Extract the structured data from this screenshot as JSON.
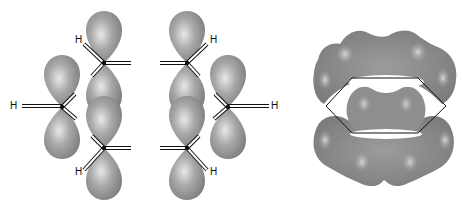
{
  "figure": {
    "left_panel": {
      "name": "p-orbital overlap diagram",
      "atom_label": "H",
      "hydrogens": [
        {
          "id": "h-left",
          "label": "H",
          "x": 10,
          "y": 101
        },
        {
          "id": "h-top-left",
          "label": "H",
          "x": 75,
          "y": 35
        },
        {
          "id": "h-bottom-left",
          "label": "H",
          "x": 75,
          "y": 167
        },
        {
          "id": "h-top-right",
          "label": "H",
          "x": 210,
          "y": 35
        },
        {
          "id": "h-bottom-right",
          "label": "H",
          "x": 210,
          "y": 167
        },
        {
          "id": "h-right",
          "label": "H",
          "x": 271,
          "y": 101
        }
      ]
    },
    "right_panel": {
      "name": "delocalized pi electron cloud"
    },
    "colors": {
      "orbital_fill": "#9a9a9a",
      "orbital_highlight": "#e6e6e6",
      "orbital_shadow": "#6e6e6e",
      "bond_outline": "#111111",
      "bond_fill": "#ffffff",
      "background": "#ffffff"
    }
  }
}
